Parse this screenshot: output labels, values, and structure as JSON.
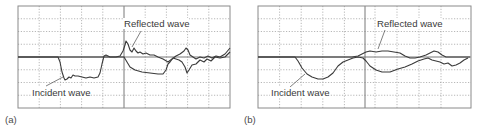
{
  "chart_data": [
    {
      "type": "line",
      "panel": "(a)",
      "title": "",
      "xlabel": "",
      "ylabel": "",
      "grid": true,
      "grid_divisions": {
        "x": 10,
        "y": 8
      },
      "annotations": [
        "Reflected wave",
        "Incident wave"
      ],
      "series": [
        {
          "name": "Incident wave",
          "points": [
            [
              18,
              57
            ],
            [
              58,
              57
            ],
            [
              60,
              62
            ],
            [
              62,
              72
            ],
            [
              64,
              78
            ],
            [
              65,
              80
            ],
            [
              67,
              79
            ],
            [
              69,
              77
            ],
            [
              71,
              78
            ],
            [
              73,
              75
            ],
            [
              75,
              76
            ],
            [
              78,
              76
            ],
            [
              82,
              77
            ],
            [
              86,
              78
            ],
            [
              90,
              77
            ],
            [
              94,
              78
            ],
            [
              98,
              77
            ],
            [
              100,
              73
            ],
            [
              102,
              64
            ],
            [
              104,
              56
            ],
            [
              106,
              55
            ],
            [
              110,
              57
            ],
            [
              120,
              57
            ],
            [
              124,
              57
            ],
            [
              127,
              62
            ],
            [
              130,
              67
            ],
            [
              135,
              70
            ],
            [
              142,
              72
            ],
            [
              150,
              73
            ],
            [
              158,
              74
            ],
            [
              163,
              74
            ],
            [
              166,
              70
            ],
            [
              168,
              64
            ],
            [
              170,
              62
            ],
            [
              173,
              58
            ],
            [
              176,
              59
            ],
            [
              179,
              60
            ],
            [
              182,
              62
            ],
            [
              185,
              67
            ],
            [
              187,
              73
            ],
            [
              189,
              70
            ],
            [
              192,
              65
            ],
            [
              196,
              64
            ],
            [
              200,
              60
            ],
            [
              204,
              62
            ],
            [
              207,
              59
            ],
            [
              211,
              61
            ],
            [
              215,
              57
            ],
            [
              220,
              58
            ],
            [
              225,
              57
            ],
            [
              230,
              52
            ]
          ]
        },
        {
          "name": "Reflected wave",
          "points": [
            [
              18,
              57
            ],
            [
              110,
              57
            ],
            [
              116,
              57
            ],
            [
              120,
              56
            ],
            [
              123,
              51
            ],
            [
              125,
              45
            ],
            [
              126,
              41
            ],
            [
              128,
              44
            ],
            [
              130,
              50
            ],
            [
              132,
              52
            ],
            [
              134,
              48
            ],
            [
              136,
              51
            ],
            [
              138,
              53
            ],
            [
              140,
              52
            ],
            [
              143,
              54
            ],
            [
              146,
              53
            ],
            [
              150,
              55
            ],
            [
              154,
              55
            ],
            [
              158,
              57
            ],
            [
              163,
              59
            ],
            [
              168,
              62
            ],
            [
              172,
              59
            ],
            [
              176,
              56
            ],
            [
              180,
              54
            ],
            [
              184,
              51
            ],
            [
              186,
              48
            ],
            [
              188,
              50
            ],
            [
              190,
              55
            ],
            [
              193,
              57
            ],
            [
              196,
              59
            ],
            [
              200,
              57
            ],
            [
              204,
              58
            ],
            [
              208,
              56
            ],
            [
              212,
              58
            ],
            [
              216,
              56
            ],
            [
              220,
              57
            ],
            [
              225,
              54
            ],
            [
              230,
              48
            ]
          ]
        }
      ]
    },
    {
      "type": "line",
      "panel": "(b)",
      "title": "",
      "xlabel": "",
      "ylabel": "",
      "grid": true,
      "grid_divisions": {
        "x": 10,
        "y": 8
      },
      "annotations": [
        "Reflected wave",
        "Incident wave"
      ],
      "series": [
        {
          "name": "Incident wave",
          "points": [
            [
              258,
              57
            ],
            [
              295,
              57
            ],
            [
              298,
              61
            ],
            [
              302,
              68
            ],
            [
              307,
              74
            ],
            [
              312,
              77
            ],
            [
              318,
              79
            ],
            [
              323,
              79
            ],
            [
              328,
              77
            ],
            [
              333,
              73
            ],
            [
              338,
              66
            ],
            [
              343,
              62
            ],
            [
              348,
              60
            ],
            [
              353,
              58
            ],
            [
              358,
              57
            ],
            [
              363,
              58
            ],
            [
              366,
              61
            ],
            [
              370,
              66
            ],
            [
              376,
              70
            ],
            [
              382,
              72
            ],
            [
              390,
              72
            ],
            [
              398,
              69
            ],
            [
              405,
              67
            ],
            [
              412,
              64
            ],
            [
              418,
              61
            ],
            [
              424,
              59
            ],
            [
              428,
              58
            ],
            [
              432,
              60
            ],
            [
              436,
              61
            ],
            [
              440,
              62
            ],
            [
              444,
              64
            ],
            [
              448,
              63
            ],
            [
              452,
              66
            ],
            [
              456,
              65
            ],
            [
              460,
              63
            ],
            [
              464,
              60
            ],
            [
              468,
              58
            ]
          ]
        },
        {
          "name": "Reflected wave",
          "points": [
            [
              258,
              57
            ],
            [
              352,
              57
            ],
            [
              358,
              56
            ],
            [
              362,
              54
            ],
            [
              366,
              52
            ],
            [
              370,
              51
            ],
            [
              376,
              52
            ],
            [
              382,
              51
            ],
            [
              388,
              51
            ],
            [
              394,
              52
            ],
            [
              400,
              53
            ],
            [
              405,
              56
            ],
            [
              410,
              58
            ],
            [
              415,
              58
            ],
            [
              420,
              57
            ],
            [
              426,
              55
            ],
            [
              430,
              53
            ],
            [
              434,
              51
            ],
            [
              438,
              52
            ],
            [
              442,
              55
            ],
            [
              446,
              57
            ],
            [
              450,
              57
            ],
            [
              458,
              57
            ],
            [
              470,
              57
            ]
          ]
        }
      ]
    }
  ],
  "panels": {
    "a": {
      "label": "(a)",
      "reflected_label": "Reflected wave",
      "incident_label": "Incident wave"
    },
    "b": {
      "label": "(b)",
      "reflected_label": "Reflected wave",
      "incident_label": "Incident wave"
    }
  }
}
